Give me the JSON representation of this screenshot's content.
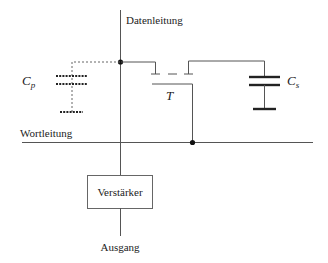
{
  "diagram": {
    "labels": {
      "data_line": "Datenleitung",
      "word_line": "Wortleitung",
      "amplifier": "Verstärker",
      "output": "Ausgang",
      "transistor": "T",
      "parasitic_cap_main": "C",
      "parasitic_cap_sub": "p",
      "storage_cap_main": "C",
      "storage_cap_sub": "s"
    },
    "components": [
      {
        "id": "Cp",
        "type": "capacitor",
        "style": "dotted",
        "role": "parasitic capacitance"
      },
      {
        "id": "T",
        "type": "transistor",
        "role": "access transistor"
      },
      {
        "id": "Cs",
        "type": "capacitor",
        "style": "solid",
        "role": "storage capacitor"
      },
      {
        "id": "amp",
        "type": "amplifier-box",
        "label": "Verstärker"
      }
    ],
    "colors": {
      "wire": "#555555",
      "text": "#222222",
      "background": "#ffffff"
    }
  }
}
